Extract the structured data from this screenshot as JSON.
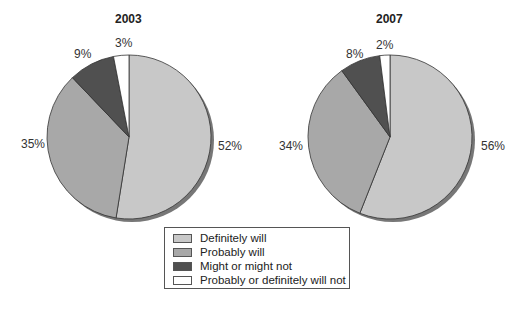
{
  "chart_data": [
    {
      "type": "pie",
      "title": "2003",
      "categories": [
        "Definitely will",
        "Probably will",
        "Might or might not",
        "Probably or definitely will not"
      ],
      "values": [
        52,
        35,
        9,
        3
      ],
      "labels": [
        "52%",
        "35%",
        "9%",
        "3%"
      ]
    },
    {
      "type": "pie",
      "title": "2007",
      "categories": [
        "Definitely will",
        "Probably will",
        "Might or might not",
        "Probably or definitely will not"
      ],
      "values": [
        56,
        34,
        8,
        2
      ],
      "labels": [
        "56%",
        "34%",
        "8%",
        "2%"
      ]
    }
  ],
  "legend": {
    "position": "bottom-center",
    "items": [
      {
        "label": "Definitely will",
        "color": "#c8c8c8"
      },
      {
        "label": "Probably will",
        "color": "#a8a8a8"
      },
      {
        "label": "Might or might not",
        "color": "#505050"
      },
      {
        "label": "Probably or definitely will not",
        "color": "#ffffff"
      }
    ]
  }
}
